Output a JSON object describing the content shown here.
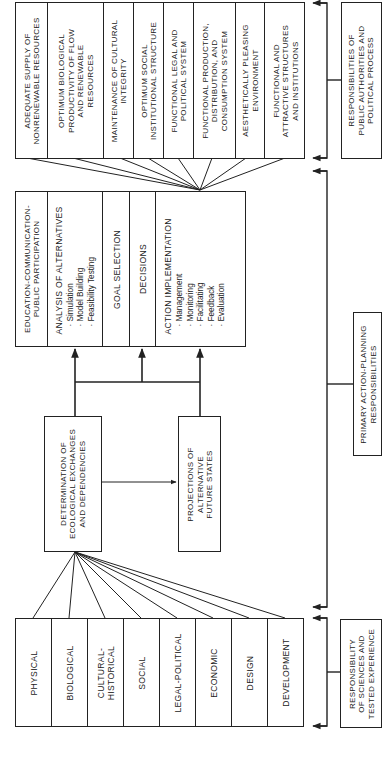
{
  "diagram": {
    "orientation": "rotated-90-ccw",
    "goals": {
      "items": [
        "ADEQUATE SUPPLY OF\nNONRENEWABLE RESOURCES",
        "OPTIMUM BIOLOGICAL\nPRODUCTIVITY OF FLOW\nAND RENEWABLE\nRESOURCES",
        "MAINTENANCE OF CULTURAL\nINTEGRITY",
        "OPTIMUM SOCIAL\nINSTITUTIONAL STRUCTURE",
        "FUNCTIONAL LEGAL AND\nPOLITICAL SYSTEM",
        "FUNCTIONAL PRODUCTION,\nDISTRIBUTION, AND\nCONSUMPTION SYSTEM",
        "AESTHETICALLY PLEASING\nENVIRONMENT",
        "FUNCTIONAL AND\nATTRACTIVE STRUCTURES\nAND INSTITUTIONS"
      ]
    },
    "planning_process": {
      "education": "EDUCATION-COMMUNICATION-\nPUBLIC PARTICIPATION",
      "analysis": {
        "title": "ANALYSIS OF ALTERNATIVES",
        "items": [
          "· Simulation",
          "· Model Building",
          "· Feasibility Testing"
        ]
      },
      "goal_selection": "GOAL SELECTION",
      "decisions": "DECISIONS",
      "action": {
        "title": "ACTION IMPLEMENTATION",
        "items": [
          "· Management",
          "· Monitoring",
          "· Facilitating",
          "· Feedback",
          "· Evaluation"
        ]
      }
    },
    "determination": "DETERMINATION OF\nECOLOGICAL EXCHANGES\nAND DEPENDENCIES",
    "projections": "PROJECTIONS OF\nALTERNATIVE\nFUTURE STATES",
    "inventories": {
      "items": [
        "PHYSICAL",
        "BIOLOGICAL",
        "CULTURAL-\nHISTORICAL",
        "SOCIAL",
        "LEGAL-POLITICAL",
        "ECONOMIC",
        "DESIGN",
        "DEVELOPMENT"
      ]
    },
    "responsibilities": {
      "public_authorities": "RESPONSIBILITIES OF\nPUBLIC AUTHORITIES AND\nPOLITICAL PROCESS",
      "action_planning": "PRIMARY ACTION-PLANNING\nRESPONSIBILITIES",
      "sciences": "RESPONSIBILITY\nOF SCIENCES AND\nTESTED EXPERIENCE"
    },
    "colors": {
      "line": "#222222",
      "background": "#ffffff"
    }
  }
}
